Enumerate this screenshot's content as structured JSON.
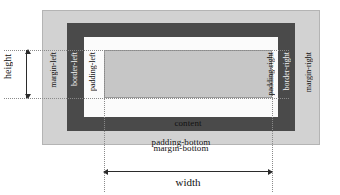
{
  "diagram": {
    "type": "box-model-diagram",
    "boxes": {
      "margin": {
        "label": "margin",
        "color": "#d2d2d2"
      },
      "border": {
        "label": "border",
        "color": "#4a4a4a"
      },
      "padding": {
        "label": "padding",
        "color": "#fbfbfb"
      },
      "content": {
        "label": "content",
        "color": "#c6c6c6"
      }
    },
    "labels": {
      "margin_top": "margin-top",
      "border_top": "border-top",
      "padding_top": "padding-top",
      "content": "content",
      "padding_bottom": "padding-bottom",
      "border_bottom": "border-bottom",
      "margin_bottom": "margin-bottom",
      "margin_left": "margin-left",
      "border_left": "border-left",
      "padding_left": "padding-left",
      "padding_right": "padding-right",
      "border_right": "border-right",
      "margin_right": "margin-right"
    },
    "measurements": {
      "height": "height",
      "width": "width"
    }
  }
}
